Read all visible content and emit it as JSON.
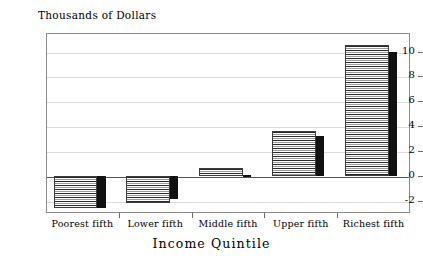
{
  "chart_data": {
    "type": "bar",
    "title": "",
    "ylabel": "Thousands of Dollars",
    "xlabel": "Income Quintile",
    "categories": [
      "Poorest fifth",
      "Lower fifth",
      "Middle fifth",
      "Upper fifth",
      "Richest fifth"
    ],
    "series": [
      {
        "name": "series-striped",
        "style": "striped",
        "values": [
          -2.6,
          -2.2,
          0.6,
          3.6,
          10.5
        ]
      },
      {
        "name": "series-solid",
        "style": "solid",
        "values": [
          -2.6,
          -1.9,
          0.1,
          3.2,
          10.0
        ]
      }
    ],
    "ylim": [
      -3.0,
      11.5
    ],
    "yticks": [
      10,
      8,
      6,
      4,
      2,
      0,
      -2
    ],
    "ytick_labels": [
      "10",
      "8",
      "6",
      "4",
      "2",
      "0",
      "-2"
    ],
    "grid": true,
    "legend": "none",
    "zero_line": true
  },
  "colors": {
    "frame": "#8a8a8a",
    "gridline": "#dcdcdc",
    "zero_line": "#555555",
    "bar_solid": "#111111",
    "bar_striped_fill": "#f2f2f2",
    "background": "#ffffff"
  }
}
